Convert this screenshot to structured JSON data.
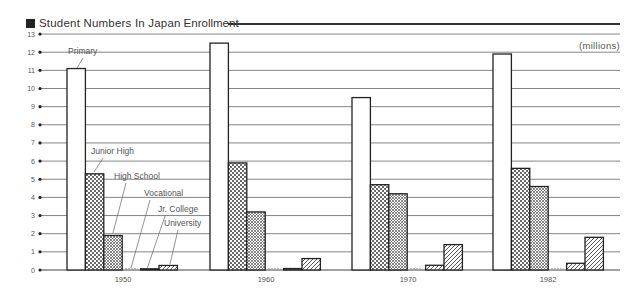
{
  "header": {
    "title": "Student Numbers In Japan",
    "subtitle": "Enrollment",
    "units": "(millions)"
  },
  "chart_data": {
    "type": "bar",
    "title": "Student Numbers In Japan Enrollment",
    "xlabel": "",
    "ylabel": "(millions)",
    "ylim": [
      0,
      13
    ],
    "yticks": [
      0,
      1,
      2,
      3,
      4,
      5,
      6,
      7,
      8,
      9,
      10,
      11,
      12,
      13
    ],
    "grid": true,
    "legend_position": "inline annotations on 1950 group",
    "categories": [
      "1950",
      "1960",
      "1970",
      "1982"
    ],
    "series": [
      {
        "name": "Primary",
        "pattern": "white",
        "values": [
          11.1,
          12.5,
          9.5,
          11.9
        ]
      },
      {
        "name": "Junior High",
        "pattern": "dots",
        "values": [
          5.3,
          5.9,
          4.7,
          5.6
        ]
      },
      {
        "name": "High School",
        "pattern": "crosshatch",
        "values": [
          1.9,
          3.2,
          4.2,
          4.6
        ]
      },
      {
        "name": "Vocational",
        "pattern": "dotted-outline",
        "values": [
          0.0,
          0.0,
          0.0,
          0.0
        ]
      },
      {
        "name": "Jr. College",
        "pattern": "diagonal",
        "values": [
          0.02,
          0.08,
          0.26,
          0.37
        ]
      },
      {
        "name": "University",
        "pattern": "diagonal",
        "values": [
          0.25,
          0.63,
          1.4,
          1.8
        ]
      }
    ]
  }
}
